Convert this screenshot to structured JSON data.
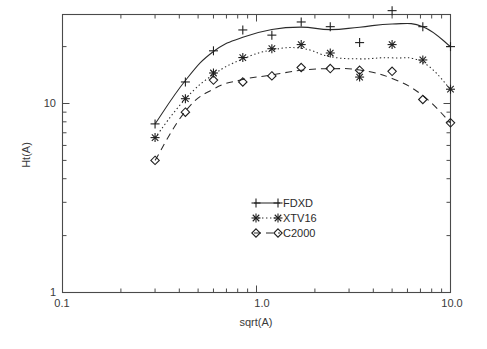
{
  "chart_data": {
    "type": "line",
    "title": "",
    "xlabel": "sqrt(A)",
    "ylabel": "Ht(A)",
    "xscale": "log",
    "yscale": "log",
    "xlim": [
      0.1,
      10.0
    ],
    "ylim": [
      1,
      40
    ],
    "grid": false,
    "legend_position": "center",
    "x_tick_labels": [
      "0.1",
      "1.0",
      "10.0"
    ],
    "x_tick_values": [
      0.1,
      1.0,
      10.0
    ],
    "y_tick_labels": [
      "1",
      "10"
    ],
    "y_tick_values": [
      1,
      10
    ],
    "series": [
      {
        "name": "FDXD",
        "marker": "plus",
        "line": "solid",
        "x": [
          0.3,
          0.43,
          0.6,
          0.85,
          1.2,
          1.7,
          2.4,
          3.4,
          5.0,
          7.2,
          10.0
        ],
        "y": [
          7.8,
          13.0,
          19.0,
          24.5,
          23.0,
          27.0,
          25.5,
          21.0,
          31.0,
          25.5,
          20.0
        ]
      },
      {
        "name": "XTV16",
        "marker": "asterisk",
        "line": "dotted",
        "x": [
          0.3,
          0.43,
          0.6,
          0.85,
          1.2,
          1.7,
          2.4,
          3.4,
          5.0,
          7.2,
          10.0
        ],
        "y": [
          6.6,
          10.6,
          14.5,
          17.5,
          19.5,
          20.5,
          18.5,
          13.8,
          20.5,
          17.0,
          11.9
        ]
      },
      {
        "name": "C2000",
        "marker": "diamond",
        "line": "dashed",
        "x": [
          0.3,
          0.43,
          0.6,
          0.85,
          1.2,
          1.7,
          2.4,
          3.4,
          5.0,
          7.2,
          10.0
        ],
        "y": [
          5.0,
          9.0,
          13.3,
          13.0,
          14.0,
          15.5,
          15.3,
          15.0,
          14.8,
          10.5,
          7.9
        ]
      }
    ]
  },
  "axes": {
    "x_label": "sqrt(A)",
    "y_label": "Ht(A)",
    "x_ticks": [
      {
        "label": "0.1",
        "value": 0.1
      },
      {
        "label": "1.0",
        "value": 1.0
      },
      {
        "label": "10.0",
        "value": 10.0
      }
    ],
    "y_ticks": [
      {
        "label": "1",
        "value": 1
      },
      {
        "label": "10",
        "value": 10
      }
    ]
  },
  "legend": {
    "entries": [
      {
        "label": "FDXD",
        "marker": "plus",
        "line": "solid"
      },
      {
        "label": "XTV16",
        "marker": "asterisk",
        "line": "dotted"
      },
      {
        "label": "C2000",
        "marker": "diamond",
        "line": "dashed"
      }
    ]
  }
}
